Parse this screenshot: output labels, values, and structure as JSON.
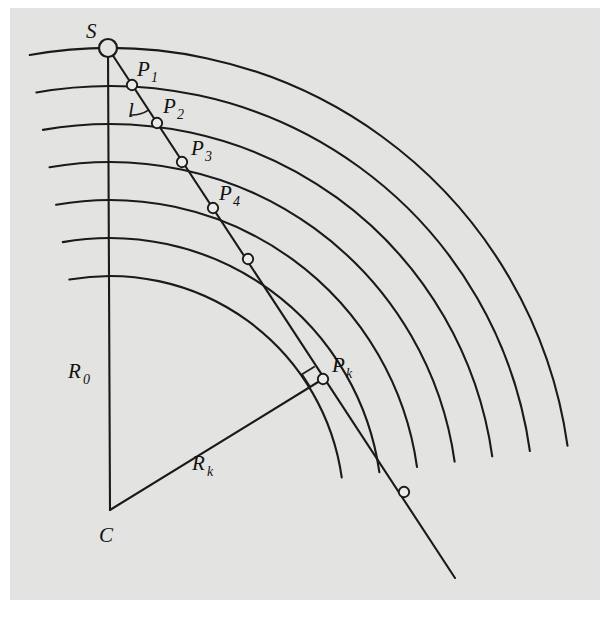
{
  "figure": {
    "background_color": "#e3e3e1",
    "page_color": "#ffffff",
    "stroke_color": "#1a1a1a",
    "marker_fill": "#ebebe9",
    "frame": {
      "x": 10,
      "y": 8,
      "width": 590,
      "height": 592
    },
    "center": {
      "name": "C",
      "x": 110,
      "y": 510
    },
    "source": {
      "name": "S",
      "x": 108,
      "y": 48,
      "marker_radius": 9
    }
  },
  "labels": {
    "source": "S",
    "center": "C",
    "radius_initial": "R",
    "radius_initial_sub": "0",
    "radius_k": "R",
    "radius_k_sub": "k",
    "angle": "l",
    "p1": "P",
    "p1_sub": "1",
    "p2": "P",
    "p2_sub": "2",
    "p3": "P",
    "p3_sub": "3",
    "p4": "P",
    "p4_sub": "4",
    "pk": "P",
    "pk_sub": "k"
  },
  "chart_data": {
    "type": "diagram",
    "center_c": [
      110,
      510
    ],
    "radii": [
      462,
      424,
      386,
      348,
      310,
      272,
      234
    ],
    "arc_start_angle_deg": -100,
    "arc_end_angle_deg": -8,
    "ray": {
      "from": [
        108,
        48
      ],
      "to": [
        455,
        578
      ]
    },
    "intersection_points": [
      {
        "label": "P1",
        "x": 132,
        "y": 85
      },
      {
        "label": "P2",
        "x": 157,
        "y": 123
      },
      {
        "label": "P3",
        "x": 182,
        "y": 162
      },
      {
        "label": "P4",
        "x": 213,
        "y": 208
      },
      {
        "label": "P5",
        "x": 248,
        "y": 259
      },
      {
        "label": "Pk",
        "x": 323,
        "y": 379
      },
      {
        "label": "P7",
        "x": 404,
        "y": 492
      }
    ],
    "segments": [
      {
        "name": "R0",
        "from": [
          110,
          510
        ],
        "to": [
          108,
          48
        ]
      },
      {
        "name": "Rk",
        "from": [
          110,
          510
        ],
        "to": [
          323,
          379
        ]
      }
    ],
    "angle_marker": {
      "at": [
        132,
        85
      ],
      "label": "l"
    },
    "right_angle_marker": {
      "at": [
        323,
        379
      ]
    }
  },
  "label_positions": {
    "s": {
      "x": 86,
      "y": 38
    },
    "p1": {
      "x": 137,
      "y": 76
    },
    "p2": {
      "x": 163,
      "y": 113
    },
    "p3": {
      "x": 191,
      "y": 155
    },
    "p4": {
      "x": 219,
      "y": 200
    },
    "pk": {
      "x": 332,
      "y": 372
    },
    "l": {
      "x": 128,
      "y": 117
    },
    "r0": {
      "x": 68,
      "y": 378
    },
    "rk": {
      "x": 192,
      "y": 470
    },
    "c": {
      "x": 99,
      "y": 542
    }
  }
}
